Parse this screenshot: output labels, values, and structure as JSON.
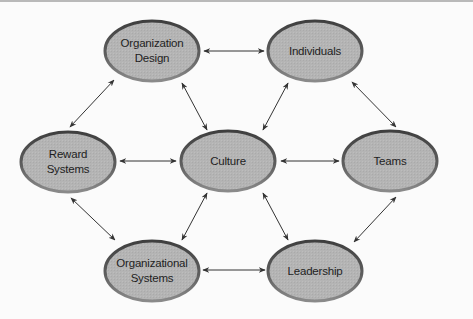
{
  "diagram": {
    "type": "network",
    "colors": {
      "background": "#fbfbfb",
      "node_fill": "#b4b4b4",
      "node_stroke": "#555555",
      "edge": "#333333",
      "text": "#1e1e1e"
    },
    "nodes": [
      {
        "id": "org_design",
        "label_lines": [
          "Organization",
          "Design"
        ],
        "cx": 152,
        "cy": 51
      },
      {
        "id": "individuals",
        "label_lines": [
          "Individuals"
        ],
        "cx": 315,
        "cy": 51
      },
      {
        "id": "reward_systems",
        "label_lines": [
          "Reward",
          "Systems"
        ],
        "cx": 68,
        "cy": 162
      },
      {
        "id": "culture",
        "label_lines": [
          "Culture"
        ],
        "cx": 228,
        "cy": 161
      },
      {
        "id": "teams",
        "label_lines": [
          "Teams"
        ],
        "cx": 390,
        "cy": 161
      },
      {
        "id": "org_systems",
        "label_lines": [
          "Organizational",
          "Systems"
        ],
        "cx": 152,
        "cy": 271
      },
      {
        "id": "leadership",
        "label_lines": [
          "Leadership"
        ],
        "cx": 315,
        "cy": 271
      }
    ],
    "edges": [
      {
        "from": "org_design",
        "to": "individuals",
        "direction": "both"
      },
      {
        "from": "org_design",
        "to": "reward_systems",
        "direction": "both"
      },
      {
        "from": "org_design",
        "to": "culture",
        "direction": "both"
      },
      {
        "from": "individuals",
        "to": "culture",
        "direction": "both"
      },
      {
        "from": "individuals",
        "to": "teams",
        "direction": "both"
      },
      {
        "from": "reward_systems",
        "to": "culture",
        "direction": "both"
      },
      {
        "from": "culture",
        "to": "teams",
        "direction": "both"
      },
      {
        "from": "reward_systems",
        "to": "org_systems",
        "direction": "both"
      },
      {
        "from": "culture",
        "to": "org_systems",
        "direction": "both"
      },
      {
        "from": "culture",
        "to": "leadership",
        "direction": "both"
      },
      {
        "from": "teams",
        "to": "leadership",
        "direction": "both"
      },
      {
        "from": "org_systems",
        "to": "leadership",
        "direction": "both"
      }
    ]
  },
  "labels": {
    "org_design_1": "Organization",
    "org_design_2": "Design",
    "individuals": "Individuals",
    "reward_1": "Reward",
    "reward_2": "Systems",
    "culture": "Culture",
    "teams": "Teams",
    "org_systems_1": "Organizational",
    "org_systems_2": "Systems",
    "leadership": "Leadership"
  }
}
